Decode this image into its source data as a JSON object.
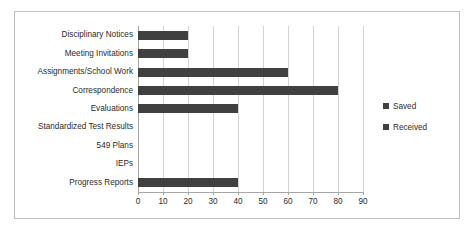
{
  "chart_data": {
    "type": "bar",
    "orientation": "horizontal",
    "title": "",
    "xlabel": "",
    "ylabel": "",
    "xlim": [
      0,
      90
    ],
    "xticks": [
      0,
      10,
      20,
      30,
      40,
      50,
      60,
      70,
      80,
      90
    ],
    "grid": true,
    "legend_position": "right",
    "categories": [
      "Disciplinary Notices",
      "Meeting Invitations",
      "Assignments/School Work",
      "Correspondence",
      "Evaluations",
      "Standardized Test Results",
      "549 Plans",
      "IEPs",
      "Progress Reports"
    ],
    "series": [
      {
        "name": "Saved",
        "color": "#404040",
        "values": [
          20,
          20,
          60,
          80,
          40,
          0,
          0,
          0,
          40
        ]
      },
      {
        "name": "Received",
        "color": "#404040",
        "values": [
          0,
          0,
          0,
          0,
          0,
          0,
          0,
          0,
          0
        ]
      }
    ]
  },
  "legend": {
    "items": [
      {
        "label": "Saved",
        "color": "#404040"
      },
      {
        "label": "Received",
        "color": "#404040"
      }
    ]
  },
  "axis": {
    "tick_labels": [
      "0",
      "10",
      "20",
      "30",
      "40",
      "50",
      "60",
      "70",
      "80",
      "90"
    ]
  },
  "colors": {
    "bar": "#404040",
    "gridline": "#d2d2d2",
    "axis": "#a6a6a6",
    "frame_border": "#bfbfbf",
    "text": "#2b2b2b",
    "background": "#ffffff"
  }
}
